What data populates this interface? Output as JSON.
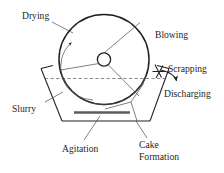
{
  "figure": {
    "background_color": "#ffffff",
    "line_color": "#231f20",
    "accent_gray": "#5c5c5c",
    "dash_color": "#6b6b6b"
  },
  "labels": {
    "drying": "Drying",
    "blowing": "Blowing",
    "scrapping": "Scrapping",
    "discharging": "Discharging",
    "slurry": "Slurry",
    "agitation": "Agitation",
    "cake_line1": "Cake",
    "cake_line2": "Formation"
  },
  "components": {
    "drum": "rotating-drum",
    "hub": "center-hub",
    "spokes": 3,
    "trough": "slurry-trough",
    "liquid_level": "slurry-level-dashed-line",
    "scraper_blade": "scraper-blade",
    "agitator": "agitator-bar",
    "rotation_arrow": "counter-clockwise-rotation-arrow",
    "discharge_arrow": "discharge-direction-arrow"
  }
}
